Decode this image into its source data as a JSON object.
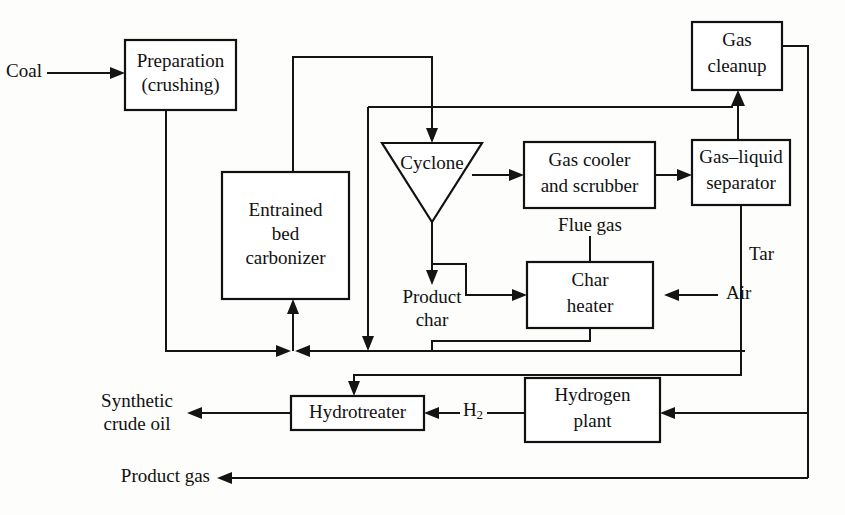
{
  "diagram": {
    "line_color": "#141414",
    "box_fill": "#ffffff",
    "background": "#fdfdfb"
  },
  "units": [
    {
      "id": "preparation",
      "line1": "Preparation",
      "line2": "(crushing)",
      "shape": "rect"
    },
    {
      "id": "carbonizer",
      "line1": "Entrained",
      "line2": "bed",
      "line3": "carbonizer",
      "shape": "rect"
    },
    {
      "id": "cyclone",
      "line1": "Cyclone",
      "shape": "triangle-down"
    },
    {
      "id": "gas-cooler",
      "line1": "Gas cooler",
      "line2": "and scrubber",
      "shape": "rect"
    },
    {
      "id": "gas-liquid-separator",
      "line1": "Gas–liquid",
      "line2": "separator",
      "shape": "rect"
    },
    {
      "id": "gas-cleanup",
      "line1": "Gas",
      "line2": "cleanup",
      "shape": "rect"
    },
    {
      "id": "char-heater",
      "line1": "Char",
      "line2": "heater",
      "shape": "rect"
    },
    {
      "id": "hydrotreater",
      "line1": "Hydrotreater",
      "shape": "rect"
    },
    {
      "id": "hydrogen-plant",
      "line1": "Hydrogen",
      "line2": "plant",
      "shape": "rect"
    }
  ],
  "streams": [
    {
      "id": "coal",
      "label": "Coal"
    },
    {
      "id": "product-char",
      "line1": "Product",
      "line2": "char"
    },
    {
      "id": "flue-gas",
      "label": "Flue gas"
    },
    {
      "id": "air",
      "label": "Air"
    },
    {
      "id": "tar",
      "label": "Tar"
    },
    {
      "id": "hydrogen",
      "label": "H",
      "subscript": "2"
    },
    {
      "id": "synthetic-crude-oil",
      "line1": "Synthetic",
      "line2": "crude oil"
    },
    {
      "id": "product-gas",
      "label": "Product gas"
    }
  ]
}
